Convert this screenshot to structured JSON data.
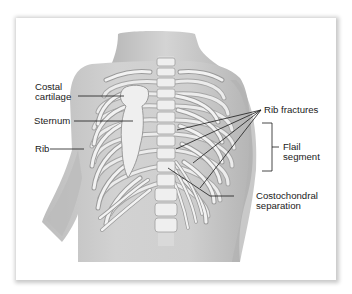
{
  "figure": {
    "colors": {
      "card_background": "#ffffff",
      "skin_fill": "#c9c9c9",
      "skin_shadow": "#a9a9a9",
      "bone_fill": "#efefef",
      "bone_outline": "#9a9a9a",
      "leader_line": "#1a1a1a",
      "label_text": "#1a1a1a"
    }
  },
  "labels": {
    "costal_cartilage": {
      "line1": "Costal",
      "line2": "cartilage"
    },
    "sternum": "Sternum",
    "rib": "Rib",
    "rib_fractures": "Rib fractures",
    "flail_segment": {
      "line1": "Flail",
      "line2": "segment"
    },
    "costochondral_separation": {
      "line1": "Costochondral",
      "line2": "separation"
    }
  }
}
